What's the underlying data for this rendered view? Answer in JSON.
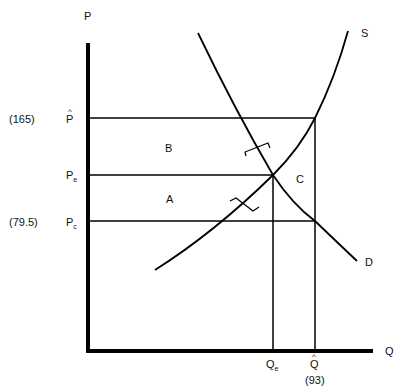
{
  "diagram": {
    "axes": {
      "y_label": "P",
      "x_label": "Q"
    },
    "curves": {
      "supply": "S",
      "demand": "D"
    },
    "price_labels": {
      "p_hat": {
        "symbol": "P",
        "value": "(165)"
      },
      "p_e": {
        "symbol": "P",
        "subscript": "e"
      },
      "p_c": {
        "symbol": "P",
        "subscript": "c",
        "value": "(79.5)"
      }
    },
    "quantity_labels": {
      "q_e": {
        "symbol": "Q",
        "subscript": "e"
      },
      "q_hat": {
        "symbol": "Q",
        "value": "(93)"
      }
    },
    "regions": {
      "a": "A",
      "b": "B",
      "c": "C"
    }
  }
}
